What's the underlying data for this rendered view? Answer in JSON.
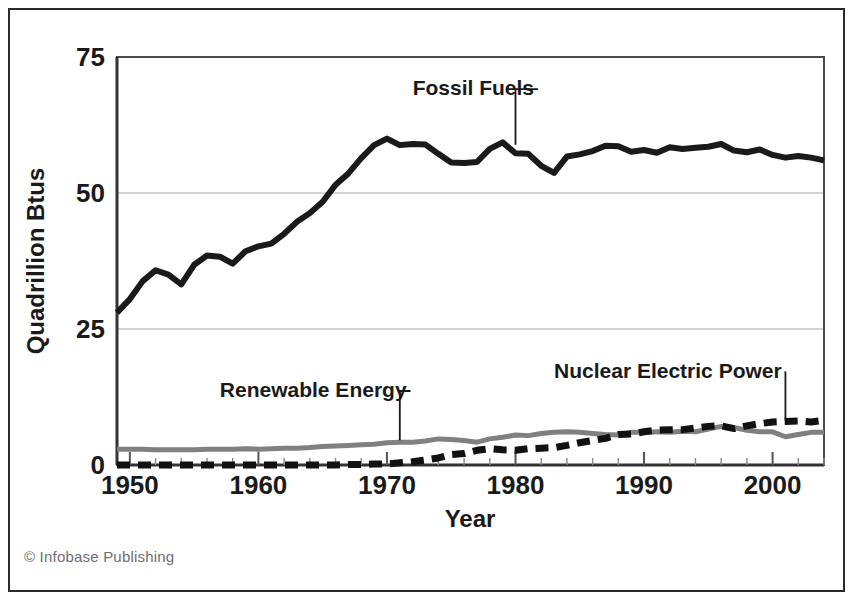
{
  "figure": {
    "credit": "© Infobase Publishing",
    "frame_color": "#2b2b2b",
    "background": "#ffffff"
  },
  "chart_data": {
    "type": "line",
    "title": "",
    "subtitle": "",
    "xlabel": "Year",
    "ylabel": "Quadrillion Btus",
    "xlim": [
      1949,
      2004
    ],
    "ylim": [
      0,
      75
    ],
    "xticks": [
      1950,
      1960,
      1970,
      1980,
      1990,
      2000
    ],
    "xtick_labels": [
      "1950",
      "1960",
      "1970",
      "1980",
      "1990",
      "2000"
    ],
    "yticks": [
      0,
      25,
      50,
      75
    ],
    "ytick_labels": [
      "0",
      "25",
      "50",
      "75"
    ],
    "grid": "horizontal-light",
    "legend": "inline-annotations",
    "x": [
      1949,
      1950,
      1951,
      1952,
      1953,
      1954,
      1955,
      1956,
      1957,
      1958,
      1959,
      1960,
      1961,
      1962,
      1963,
      1964,
      1965,
      1966,
      1967,
      1968,
      1969,
      1970,
      1971,
      1972,
      1973,
      1974,
      1975,
      1976,
      1977,
      1978,
      1979,
      1980,
      1981,
      1982,
      1983,
      1984,
      1985,
      1986,
      1987,
      1988,
      1989,
      1990,
      1991,
      1992,
      1993,
      1994,
      1995,
      1996,
      1997,
      1998,
      1999,
      2000,
      2001,
      2002,
      2003,
      2004
    ],
    "series": [
      {
        "name": "Fossil Fuels",
        "color": "#1a1a1a",
        "style": "solid",
        "width": 6,
        "label_x": 1972,
        "label_y": 68,
        "values": [
          28.0,
          30.5,
          33.8,
          35.8,
          35.0,
          33.2,
          36.8,
          38.5,
          38.3,
          37.0,
          39.3,
          40.2,
          40.7,
          42.5,
          44.7,
          46.3,
          48.4,
          51.5,
          53.6,
          56.4,
          58.8,
          60.0,
          58.8,
          59.0,
          58.9,
          57.2,
          55.6,
          55.5,
          55.7,
          58.1,
          59.3,
          57.3,
          57.2,
          55.0,
          53.7,
          56.7,
          57.1,
          57.7,
          58.7,
          58.6,
          57.6,
          57.9,
          57.4,
          58.4,
          58.1,
          58.3,
          58.5,
          59.0,
          57.8,
          57.5,
          58.0,
          57.0,
          56.5,
          56.8,
          56.5,
          56.0
        ]
      },
      {
        "name": "Renewable Energy",
        "color": "#808080",
        "style": "solid",
        "width": 5,
        "label_x": 1957,
        "label_y": 12.5,
        "values": [
          2.9,
          2.9,
          2.9,
          2.8,
          2.8,
          2.8,
          2.8,
          2.9,
          2.9,
          2.9,
          3.0,
          2.9,
          3.0,
          3.1,
          3.1,
          3.2,
          3.4,
          3.5,
          3.6,
          3.7,
          3.8,
          4.1,
          4.2,
          4.2,
          4.4,
          4.8,
          4.7,
          4.5,
          4.2,
          4.8,
          5.1,
          5.5,
          5.4,
          5.8,
          6.0,
          6.1,
          6.0,
          5.8,
          5.6,
          5.5,
          6.0,
          6.0,
          6.1,
          6.0,
          6.2,
          6.1,
          6.6,
          7.1,
          6.9,
          6.4,
          6.1,
          6.1,
          5.2,
          5.6,
          6.0,
          6.0
        ]
      },
      {
        "name": "Nuclear Electric Power",
        "color": "#111111",
        "style": "dashed",
        "width": 7,
        "label_x": 1983,
        "label_y": 16,
        "values": [
          0.0,
          0.0,
          0.0,
          0.0,
          0.0,
          0.0,
          0.0,
          0.0,
          0.0,
          0.0,
          0.0,
          0.0,
          0.0,
          0.0,
          0.0,
          0.0,
          0.0,
          0.0,
          0.1,
          0.1,
          0.2,
          0.2,
          0.4,
          0.6,
          0.9,
          1.3,
          1.9,
          2.1,
          2.7,
          3.0,
          2.8,
          2.7,
          3.0,
          3.1,
          3.2,
          3.6,
          4.1,
          4.5,
          4.9,
          5.6,
          5.7,
          6.1,
          6.4,
          6.5,
          6.5,
          6.8,
          7.1,
          7.2,
          6.7,
          7.2,
          7.6,
          7.9,
          8.0,
          8.1,
          7.9,
          8.2
        ]
      }
    ],
    "annotations": [
      {
        "text": "Fossil Fuels",
        "leader": "down-right"
      },
      {
        "text": "Renewable Energy",
        "leader": "down-right"
      },
      {
        "text": "Nuclear Electric Power",
        "leader": "down-right"
      }
    ]
  }
}
